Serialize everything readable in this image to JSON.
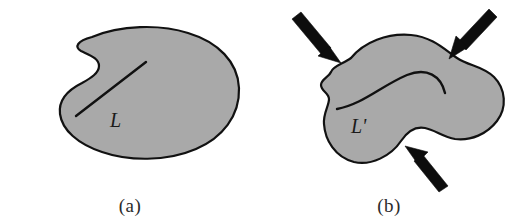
{
  "figure": {
    "background_color": "#ffffff",
    "body_fill_color": "#a9a9a9",
    "outline_color": "#111111",
    "arrow_color": "#0d0d0d"
  },
  "panels": [
    {
      "id": "a",
      "caption": "(a)",
      "state": "undeformed",
      "line_label": "L",
      "line_type": "straight",
      "load_count": 0
    },
    {
      "id": "b",
      "caption": "(b)",
      "state": "deformed",
      "line_label": "L'",
      "line_type": "curved",
      "load_count": 3,
      "loads": [
        {
          "name": "load-arrow-top-left",
          "direction": "down-right"
        },
        {
          "name": "load-arrow-top-right",
          "direction": "down-left"
        },
        {
          "name": "load-arrow-bottom",
          "direction": "up-left"
        }
      ]
    }
  ]
}
